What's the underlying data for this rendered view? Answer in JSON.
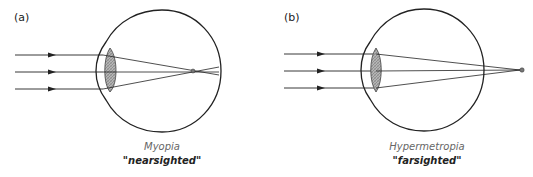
{
  "figure": {
    "panels": [
      {
        "id": "a",
        "label": "(a)",
        "condition": "Myopia",
        "description": "\"nearsighted\"",
        "focal_point": "in front of retina"
      },
      {
        "id": "b",
        "label": "(b)",
        "condition": "Hypermetropia",
        "description": "\"farsighted\"",
        "focal_point": "behind retina"
      }
    ],
    "colors": {
      "line": "#222222",
      "lens_fill": "#a8a8a8",
      "caption_title": "#666666"
    }
  }
}
